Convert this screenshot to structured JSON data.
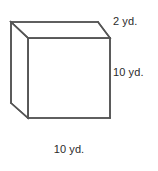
{
  "figure": {
    "kind": "rectangular-prism-diagram",
    "shape_name": "cube",
    "units": "yd.",
    "stroke_color": "#555555",
    "background_color": "#ffffff",
    "text_color": "#2b2b2b",
    "labels": {
      "depth": "2 yd.",
      "height": "10 yd.",
      "width": "10 yd."
    },
    "dimensions": {
      "depth_value": 2,
      "height_value": 10,
      "width_value": 10,
      "unit": "yd."
    },
    "geometry": {
      "projection": "oblique",
      "vertices": {
        "back_top_left": [
          11,
          22
        ],
        "back_top_right": [
          98,
          22
        ],
        "back_bottom_left": [
          11,
          103
        ],
        "front_top_left": [
          28,
          38
        ],
        "front_top_right": [
          110,
          38
        ],
        "front_bottom_left": [
          28,
          118
        ],
        "front_bottom_right": [
          110,
          118
        ]
      }
    }
  }
}
